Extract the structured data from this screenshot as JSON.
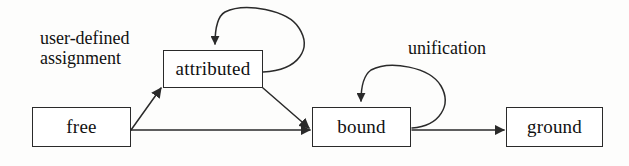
{
  "diagram": {
    "type": "state-transition-diagram",
    "background_color": "#fdfdfc",
    "stroke_color": "#2a2a2a",
    "text_color": "#111111",
    "nodes": [
      {
        "id": "free",
        "label": "free"
      },
      {
        "id": "attributed",
        "label": "attributed"
      },
      {
        "id": "bound",
        "label": "bound"
      },
      {
        "id": "ground",
        "label": "ground"
      }
    ],
    "edge_labels": [
      {
        "id": "user-defined-assignment",
        "text": "user-defined\nassignment"
      },
      {
        "id": "unification",
        "text": "unification"
      }
    ],
    "edges": [
      {
        "from": "free",
        "to": "attributed",
        "label": "user-defined assignment",
        "style": "diagonal-up"
      },
      {
        "from": "free",
        "to": "bound",
        "label": "",
        "style": "horizontal"
      },
      {
        "from": "attributed",
        "to": "attributed",
        "label": "user-defined assignment",
        "style": "self-loop"
      },
      {
        "from": "attributed",
        "to": "bound",
        "label": "",
        "style": "diagonal-down"
      },
      {
        "from": "bound",
        "to": "bound",
        "label": "unification",
        "style": "self-loop"
      },
      {
        "from": "bound",
        "to": "ground",
        "label": "",
        "style": "horizontal"
      }
    ]
  }
}
